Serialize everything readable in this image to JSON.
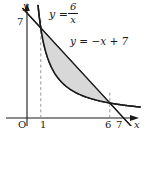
{
  "figure": {
    "background": "#ffffff",
    "ink_color": "#1a1a1a",
    "shade_color": "#d8d8d8",
    "labels": {
      "y_axis": "y",
      "x_axis": "x",
      "origin": "O",
      "x_tick_1": "1",
      "x_tick_6": "6",
      "x_tick_7": "7",
      "y_tick_7": "7",
      "hyperbola_lhs": "y =",
      "hyperbola_num": "6",
      "hyperbola_den": "x",
      "line_equation": "y = −x + 7"
    }
  },
  "chart_data": {
    "type": "line",
    "title": "",
    "xlabel": "x",
    "ylabel": "y",
    "xlim": [
      -0.7,
      8.2
    ],
    "ylim": [
      -0.9,
      7.9
    ],
    "grid": false,
    "legend": "none",
    "axis_ticks": {
      "x": [
        1,
        6,
        7
      ],
      "y": [
        7
      ]
    },
    "origin_label": "O",
    "series": [
      {
        "name": "y = 6/x",
        "kind": "hyperbola",
        "equation": "y = 6/x",
        "x": [
          0.78,
          0.9,
          1.0,
          1.2,
          1.5,
          2.0,
          2.5,
          3.0,
          3.5,
          4.0,
          4.5,
          5.0,
          5.5,
          6.0,
          6.5,
          7.0,
          7.5,
          8.0
        ],
        "y": [
          7.69,
          6.67,
          6.0,
          5.0,
          4.0,
          3.0,
          2.4,
          2.0,
          1.71,
          1.5,
          1.33,
          1.2,
          1.09,
          1.0,
          0.92,
          0.857,
          0.8,
          0.75
        ],
        "label": "y = 6/x"
      },
      {
        "name": "y = -x + 7",
        "kind": "line",
        "equation": "y = -x + 7",
        "slope": -1,
        "intercept": 7,
        "x": [
          -0.3,
          8.1
        ],
        "y": [
          7.3,
          -1.1
        ],
        "label": "y = −x + 7"
      }
    ],
    "intersections": [
      {
        "x": 1,
        "y": 6
      },
      {
        "x": 6,
        "y": 1
      }
    ],
    "shaded_region": {
      "between": [
        "y = -x + 7",
        "y = 6/x"
      ],
      "x_from": 1,
      "x_to": 6,
      "fill": "#d8d8d8"
    },
    "dashed_guides": [
      {
        "x": 1,
        "from_y": 0,
        "to_y": 6.6
      },
      {
        "x": 6,
        "from_y": 0,
        "to_y": 1.7
      }
    ]
  }
}
